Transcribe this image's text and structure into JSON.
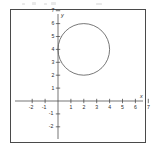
{
  "chart_data": {
    "type": "scatter",
    "title": "",
    "subtitle": "",
    "xlabel": "x",
    "ylabel": "y",
    "xlim": [
      -2.6,
      7.3
    ],
    "ylim": [
      -2.6,
      7.3
    ],
    "grid": false,
    "legend": null,
    "x_ticks": [
      -2,
      -1,
      1,
      2,
      3,
      4,
      5,
      6,
      7
    ],
    "x_tick_labels": [
      "-2",
      "-1",
      "1",
      "2",
      "3",
      "4",
      "5",
      "6",
      "7"
    ],
    "y_ticks": [
      -2,
      -1,
      1,
      2,
      3,
      4,
      5,
      6,
      7
    ],
    "y_tick_labels": [
      "-2",
      "-1",
      "1",
      "2",
      "3",
      "4",
      "5",
      "6",
      "7"
    ],
    "origin_label": "",
    "series": [
      {
        "name": "circle",
        "kind": "circle",
        "center_x": 2,
        "center_y": 4,
        "radius": 2,
        "stroke": "#555555",
        "fill": "none",
        "stroke_width": 0.8
      }
    ],
    "annotations": []
  },
  "axes": {
    "x_axis_name": "x",
    "y_axis_name": "y"
  },
  "frame": {
    "border_color": "#4a4a4a",
    "background": "#ffffff",
    "axis_color": "#3a3a3a"
  }
}
